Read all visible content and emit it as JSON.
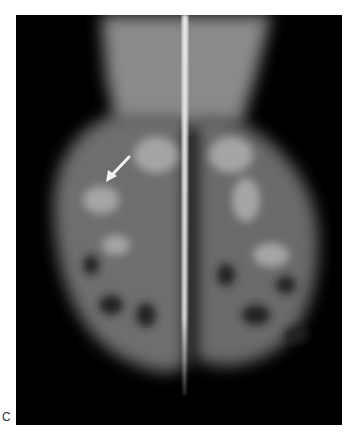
{
  "figure": {
    "panel_label": "C",
    "annotation": "white arrow pointing to focal density in left breast",
    "colors": {
      "background": "#000000",
      "tissue": "#9a9a9a",
      "arrow": "#f0f0f0"
    }
  }
}
